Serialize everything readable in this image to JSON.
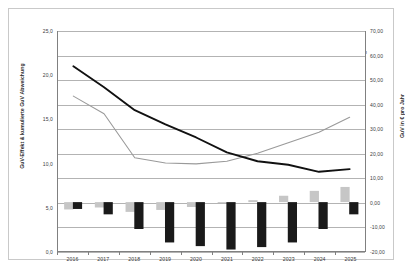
{
  "chart_data": {
    "type": "bar",
    "title": "",
    "subtitle": "",
    "xlabel": "",
    "ylabel": "GuV-Effekt & kumulierte GuV Abweichung",
    "y2label": "GuV in € pro Jahr",
    "categories": [
      "2016",
      "2017",
      "2018",
      "2019",
      "2020",
      "2021",
      "2022",
      "2023",
      "2024",
      "2025"
    ],
    "ylim": [
      0.0,
      25.0
    ],
    "yticks": [
      "0,0",
      "5,0",
      "10,0",
      "15,0",
      "20,0",
      "25,0"
    ],
    "y2lim": [
      -20.0,
      70.0
    ],
    "y2ticks": [
      "-20,00",
      "-10,00",
      "0,00",
      "10,00",
      "20,00",
      "30,00",
      "40,00",
      "50,00",
      "60,00",
      "70,00"
    ],
    "grid": true,
    "legend_position": "top",
    "series": [
      {
        "name": "GuV Abweichung bei Zinsszenario",
        "type": "bar",
        "axis": "y2",
        "color": "#c6c6c6",
        "values": [
          -3.0,
          -2.2,
          -4.0,
          -3.2,
          -2.0,
          -0.4,
          0.8,
          2.6,
          4.6,
          6.2
        ]
      },
      {
        "name": "Kumulierte GuV Abweichung bei Zinsszenario",
        "type": "bar",
        "axis": "y2",
        "color": "#1a1a1a",
        "values": [
          -2.8,
          -5.0,
          -11.0,
          -16.5,
          -18.0,
          -19.4,
          -18.4,
          -16.5,
          -11.0,
          -5.0
        ]
      },
      {
        "name": "+/- 0,00%",
        "type": "line",
        "axis": "y1",
        "color": "#111111",
        "values": [
          21.0,
          18.6,
          16.0,
          14.4,
          12.9,
          11.2,
          10.2,
          9.8,
          9.0,
          9.3
        ]
      },
      {
        "name": "Zinsszenario",
        "type": "line",
        "axis": "y1",
        "color": "#9a9a9a",
        "values": [
          17.6,
          15.6,
          10.6,
          10.0,
          9.9,
          10.2,
          11.1,
          12.3,
          13.5,
          15.2
        ]
      }
    ]
  },
  "legend": {
    "items": [
      {
        "label": "GuV Abweichung bei Zinsszenario",
        "marker": "swatch-light-icon"
      },
      {
        "label": "Kumulierte GuV Abweichung bei Zinsszenario",
        "marker": "swatch-dark-icon"
      },
      {
        "label": "+/- 0,00%",
        "marker": "line-black-icon"
      },
      {
        "label": "Zinsszenario",
        "marker": "line-gray-icon"
      }
    ]
  },
  "axes": {
    "left_title": "GuV-Effekt & kumulierte GuV Abweichung",
    "right_title": "GuV in € pro Jahr",
    "left_ticks": [
      "25,0",
      "20,0",
      "15,0",
      "10,0",
      "5,0",
      "0,0"
    ],
    "right_ticks": [
      "70,00",
      "60,00",
      "50,00",
      "40,00",
      "30,00",
      "20,00",
      "10,00",
      "0,00",
      "-10,00",
      "-20,00"
    ],
    "x_ticks": [
      "2016",
      "2017",
      "2018",
      "2019",
      "2020",
      "2021",
      "2022",
      "2023",
      "2024",
      "2025"
    ]
  }
}
